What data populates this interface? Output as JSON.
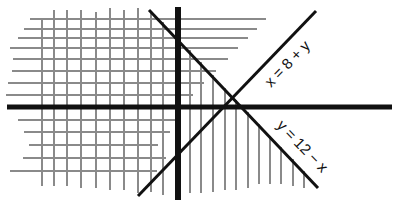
{
  "diagram": {
    "title": "",
    "lines": [
      {
        "id": "line-x-eq-8-plus-y",
        "label": "x = 8 + y",
        "x1": 138,
        "y1": 196,
        "x2": 316,
        "y2": 11
      },
      {
        "id": "line-y-eq-12-minus-x",
        "label": "y = 12 − x",
        "x1": 149,
        "y1": 10,
        "x2": 318,
        "y2": 188
      }
    ],
    "labels": {
      "line1": "x = 8 + y",
      "line2": "y = 12 − x"
    },
    "axes": {
      "horizontal": {
        "x1": 7,
        "x2": 392,
        "y": 107
      },
      "vertical": {
        "x": 178,
        "y1": 7,
        "y2": 200
      }
    },
    "colors": {
      "axis": "#111111",
      "line": "#111111",
      "hatch": "#8a8a8a",
      "background": "#ffffff"
    }
  }
}
